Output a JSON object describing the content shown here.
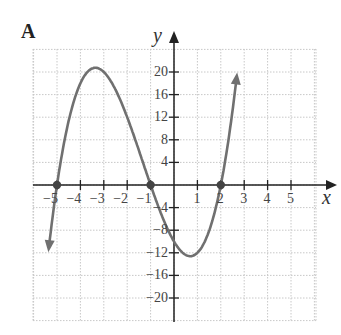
{
  "panel_label": "A",
  "colors": {
    "curve": "#707070",
    "axis": "#222222",
    "grid": "#c8c8c8",
    "point": "#444444"
  },
  "chart_data": {
    "type": "line",
    "title": "",
    "xlabel": "x",
    "ylabel": "y",
    "function": "y = (x+5)(x+1)(x-2)",
    "xlim": [
      -6,
      6
    ],
    "ylim": [
      -24,
      24
    ],
    "grid": true,
    "x_ticks": [
      -5,
      -4,
      -3,
      -2,
      -1,
      1,
      2,
      3,
      4,
      5
    ],
    "y_ticks": [
      -20,
      -16,
      -12,
      -8,
      -4,
      4,
      8,
      12,
      16,
      20
    ],
    "x_tick_labels": [
      "−5",
      "−4",
      "−3",
      "−2",
      "−1",
      "1",
      "2",
      "3",
      "4",
      "5"
    ],
    "y_tick_labels": [
      "−20",
      "−16",
      "−12",
      "−8",
      "−4",
      "4",
      "8",
      "12",
      "16",
      "20"
    ],
    "marked_points": [
      {
        "x": -5,
        "y": 0
      },
      {
        "x": -1,
        "y": 0
      },
      {
        "x": 2,
        "y": 0
      }
    ],
    "key_points": {
      "local_max": {
        "x": -3.2,
        "y": 20.7
      },
      "local_min": {
        "x": 0.5,
        "y": -12.6
      },
      "y_intercept": {
        "x": 0,
        "y": -10
      }
    },
    "x": [
      -5.5,
      -5,
      -4.5,
      -4,
      -3.5,
      -3.2,
      -3,
      -2.5,
      -2,
      -1.5,
      -1,
      -0.5,
      0,
      0.5,
      1,
      1.5,
      2,
      2.5,
      2.75
    ],
    "y": [
      -23.6,
      0,
      14.4,
      20,
      20.6,
      20.7,
      20,
      15.6,
      8,
      0,
      0,
      -5.6,
      -10,
      -12.4,
      -12,
      -8.1,
      0,
      13.1,
      21.0
    ]
  }
}
